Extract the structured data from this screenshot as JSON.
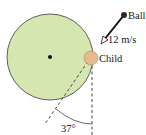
{
  "diagram": {
    "labels": {
      "ball": "Ball",
      "speed": "12 m/s",
      "child": "Child",
      "angle": "37°",
      "top_cut": "y"
    },
    "colors": {
      "merry_go_round_fill": "#d5e6b0",
      "merry_go_round_stroke": "#3a3a3a",
      "child_fill": "#e8b98a",
      "ball_fill": "#3a1f3d",
      "line": "#2a2a2a",
      "dashed": "#555555"
    }
  }
}
